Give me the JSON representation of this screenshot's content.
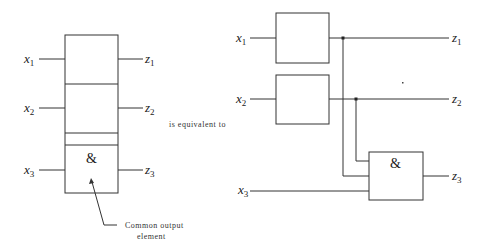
{
  "left_diagram": {
    "inputs": [
      {
        "var": "x",
        "sub": "1"
      },
      {
        "var": "x",
        "sub": "2"
      },
      {
        "var": "x",
        "sub": "3"
      }
    ],
    "outputs": [
      {
        "var": "z",
        "sub": "1"
      },
      {
        "var": "z",
        "sub": "2"
      },
      {
        "var": "z",
        "sub": "3"
      }
    ],
    "common_symbol": "&",
    "annotation_line1": "Common output",
    "annotation_line2": "element"
  },
  "connector_text": "is equivalent to",
  "right_diagram": {
    "inputs": [
      {
        "var": "x",
        "sub": "1"
      },
      {
        "var": "x",
        "sub": "2"
      },
      {
        "var": "x",
        "sub": "3"
      }
    ],
    "outputs": [
      {
        "var": "z",
        "sub": "1"
      },
      {
        "var": "z",
        "sub": "2"
      },
      {
        "var": "z",
        "sub": "3"
      }
    ],
    "and_gate_symbol": "&"
  }
}
